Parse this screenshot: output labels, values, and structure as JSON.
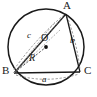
{
  "figure": {
    "type": "geometry-diagram",
    "background_color": "#ffffff",
    "stroke_color": "#1a1a1a",
    "dash_color": "#555555",
    "canvas": {
      "width": 97,
      "height": 97
    },
    "circle": {
      "name": "circumcircle",
      "cx": 46,
      "cy": 47,
      "r": 38,
      "stroke_width": 1.4,
      "style": "solid"
    },
    "center_point": {
      "name": "circumcenter",
      "label": "O",
      "x": 46,
      "y": 47,
      "dot_radius": 1.8,
      "label_x": 41,
      "label_y": 33
    },
    "vertices": [
      {
        "key": "A",
        "label": "A",
        "x": 66,
        "y": 14,
        "label_x": 63,
        "label_y": 1
      },
      {
        "key": "B",
        "label": "B",
        "x": 14,
        "y": 73,
        "label_x": 2,
        "label_y": 66
      },
      {
        "key": "C",
        "label": "C",
        "x": 80,
        "y": 72,
        "label_x": 83,
        "label_y": 66
      }
    ],
    "triangle_sides": [
      {
        "name": "side-ab",
        "from": "A",
        "to": "B",
        "style": "solid"
      },
      {
        "name": "side-bc",
        "from": "B",
        "to": "C",
        "style": "solid"
      },
      {
        "name": "side-ca",
        "from": "C",
        "to": "A",
        "style": "solid"
      }
    ],
    "side_labels": [
      {
        "key": "a",
        "label": "a",
        "opposite_vertex": "A",
        "x": 42,
        "y": 78
      },
      {
        "key": "b",
        "label": "b",
        "opposite_vertex": "B",
        "x": 71,
        "y": 38
      },
      {
        "key": "c",
        "label": "c",
        "opposite_vertex": "C",
        "x": 27,
        "y": 33
      }
    ],
    "radius_segment": {
      "name": "radius-bo",
      "label": "R",
      "from": "B",
      "to": "O",
      "style": "dashed",
      "label_x": 29,
      "label_y": 54
    },
    "dashed_guides": [
      {
        "name": "guide-b-to-a",
        "from_x": 14,
        "from_y": 73,
        "to_x": 66,
        "to_y": 14
      },
      {
        "name": "guide-b-to-o-extended",
        "from_x": 14,
        "from_y": 73,
        "to_x": 62,
        "to_y": 22
      },
      {
        "name": "guide-arc-a",
        "along": "BC"
      },
      {
        "name": "guide-arc-b",
        "along": "CA"
      },
      {
        "name": "guide-arc-c",
        "along": "AB"
      }
    ]
  }
}
